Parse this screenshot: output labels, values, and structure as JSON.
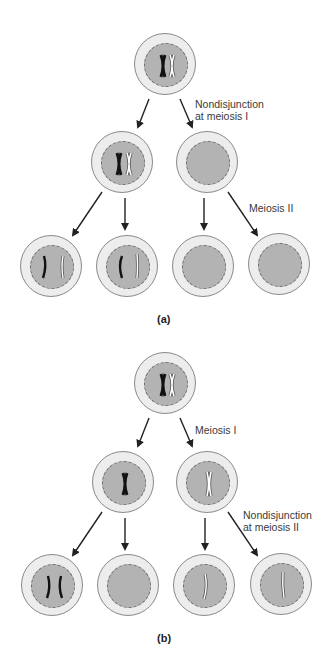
{
  "colors": {
    "cytoplasm": "#ededed",
    "nucleus": "#b3b3b3",
    "maternal_chromosome": "#111111",
    "paternal_chromosome": "#ffffff",
    "arrow": "#222222"
  },
  "panel_a": {
    "label": "(a)",
    "annotations": {
      "nondisjunction_line1": "Nondisjunction",
      "nondisjunction_line2": "at meiosis I",
      "meiosis2": "Meiosis II"
    },
    "cells": [
      {
        "id": "parent",
        "chromosomes": [
          "black-replicated",
          "white-replicated"
        ]
      },
      {
        "id": "meiosis1-left",
        "chromosomes": [
          "black-replicated",
          "white-replicated"
        ]
      },
      {
        "id": "meiosis1-right",
        "chromosomes": []
      },
      {
        "id": "gamete-1",
        "chromosomes": [
          "black-single",
          "white-single"
        ]
      },
      {
        "id": "gamete-2",
        "chromosomes": [
          "black-single",
          "white-single"
        ]
      },
      {
        "id": "gamete-3",
        "chromosomes": []
      },
      {
        "id": "gamete-4",
        "chromosomes": []
      }
    ]
  },
  "panel_b": {
    "label": "(b)",
    "annotations": {
      "meiosis1": "Meiosis I",
      "nondisjunction_line1": "Nondisjunction",
      "nondisjunction_line2": "at meiosis II"
    },
    "cells": [
      {
        "id": "parent",
        "chromosomes": [
          "black-replicated",
          "white-replicated"
        ]
      },
      {
        "id": "meiosis1-left",
        "chromosomes": [
          "black-replicated"
        ]
      },
      {
        "id": "meiosis1-right",
        "chromosomes": [
          "white-replicated"
        ]
      },
      {
        "id": "gamete-1",
        "chromosomes": [
          "black-single",
          "black-single"
        ]
      },
      {
        "id": "gamete-2",
        "chromosomes": []
      },
      {
        "id": "gamete-3",
        "chromosomes": [
          "white-single"
        ]
      },
      {
        "id": "gamete-4",
        "chromosomes": [
          "white-single"
        ]
      }
    ]
  }
}
